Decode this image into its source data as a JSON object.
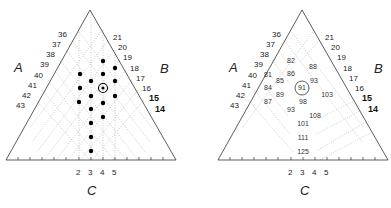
{
  "left_diagram": {
    "axis_labels": {
      "A": "A",
      "B": "B",
      "C": "C"
    },
    "a_ticks": [
      "36",
      "37",
      "38",
      "39",
      "40",
      "41",
      "42",
      "43"
    ],
    "b_ticks": [
      "21",
      "20",
      "19",
      "18",
      "17",
      "16",
      "15",
      "14"
    ],
    "c_ticks": [
      "2",
      "3",
      "4",
      "5"
    ],
    "points_marked": "filled dots at design points; one circled center point"
  },
  "right_diagram": {
    "axis_labels": {
      "A": "A",
      "B": "B",
      "C": "C"
    },
    "a_ticks": [
      "36",
      "37",
      "38",
      "39",
      "40",
      "41",
      "42",
      "43"
    ],
    "b_ticks": [
      "21",
      "20",
      "19",
      "18",
      "17",
      "16",
      "15",
      "14"
    ],
    "c_ticks": [
      "2",
      "3",
      "4",
      "5"
    ],
    "values": [
      {
        "label": "82",
        "x": 291,
        "y": 61
      },
      {
        "label": "88",
        "x": 313,
        "y": 67
      },
      {
        "label": "81",
        "x": 268,
        "y": 75
      },
      {
        "label": "86",
        "x": 291,
        "y": 74
      },
      {
        "label": "85",
        "x": 280,
        "y": 81
      },
      {
        "label": "91",
        "x": 302,
        "y": 88,
        "circled": true
      },
      {
        "label": "93",
        "x": 313,
        "y": 81
      },
      {
        "label": "84",
        "x": 268,
        "y": 88
      },
      {
        "label": "89",
        "x": 280,
        "y": 95
      },
      {
        "label": "103",
        "x": 325,
        "y": 95
      },
      {
        "label": "87",
        "x": 268,
        "y": 102
      },
      {
        "label": "98",
        "x": 302,
        "y": 102
      },
      {
        "label": "93",
        "x": 291,
        "y": 110
      },
      {
        "label": "108",
        "x": 313,
        "y": 116
      },
      {
        "label": "101",
        "x": 302,
        "y": 124
      },
      {
        "label": "111",
        "x": 302,
        "y": 138
      },
      {
        "label": "125",
        "x": 302,
        "y": 152
      }
    ]
  }
}
